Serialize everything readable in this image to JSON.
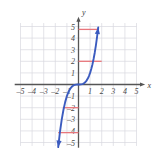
{
  "figure": {
    "background": "#ffffff",
    "grid_color": "#d8d8e0",
    "axis_color": "#555555",
    "curve_color": "#3b5bbf",
    "marker_color": "#e8767c"
  },
  "chart_data": {
    "type": "line",
    "title": "",
    "xlabel": "x",
    "ylabel": "y",
    "grid": true,
    "legend": null,
    "xlim": [
      -5.6,
      5.6
    ],
    "ylim": [
      -5.6,
      5.6
    ],
    "xticks": [
      -5,
      -4,
      -3,
      -2,
      -1,
      1,
      2,
      3,
      4,
      5
    ],
    "yticks": [
      -5,
      -4,
      -3,
      -2,
      -1,
      1,
      2,
      3,
      4,
      5
    ],
    "xtick_labels": [
      "-5",
      "-4",
      "-3",
      "-2",
      "-1",
      "1",
      "2",
      "3",
      "4",
      "5"
    ],
    "ytick_labels": [
      "-5",
      "-4",
      "-3",
      "-2",
      "-1",
      "1",
      "2",
      "3",
      "4",
      "5"
    ],
    "series": [
      {
        "name": "cubic curve",
        "color": "#3b5bbf",
        "arrow_start": true,
        "arrow_end": true,
        "x": [
          -1.75,
          -1.6,
          -1.45,
          -1.3,
          -1.15,
          -1.0,
          -0.9,
          -0.8,
          -0.7,
          -0.6,
          -0.5,
          -0.4,
          -0.3,
          -0.2,
          -0.1,
          0.0,
          0.1,
          0.2,
          0.3,
          0.4,
          0.5,
          0.6,
          0.7,
          0.8,
          0.9,
          1.0,
          1.1,
          1.2,
          1.3,
          1.4,
          1.5,
          1.6,
          1.7
        ],
        "y": [
          -5.4,
          -4.1,
          -3.05,
          -2.2,
          -1.52,
          -1.0,
          -0.73,
          -0.51,
          -0.34,
          -0.22,
          -0.13,
          -0.06,
          -0.03,
          -0.01,
          0.0,
          0.0,
          0.0,
          0.01,
          0.03,
          0.06,
          0.13,
          0.22,
          0.34,
          0.51,
          0.73,
          1.0,
          1.33,
          1.73,
          2.2,
          2.74,
          3.38,
          4.1,
          4.91
        ]
      }
    ],
    "markers": [
      {
        "name": "upper-outer-segment",
        "type": "hline",
        "y": 4.75,
        "x_start": 0.0,
        "x_end": 1.68,
        "color": "#e8767c"
      },
      {
        "name": "upper-inner-segment",
        "type": "hline",
        "y": 2.0,
        "x_start": 0.0,
        "x_end": 2.0,
        "color": "#e8767c"
      },
      {
        "name": "lower-inner-segment",
        "type": "hline",
        "y": -2.0,
        "x_start": -1.35,
        "x_end": 0.0,
        "color": "#e8767c"
      },
      {
        "name": "lower-outer-segment",
        "type": "hline",
        "y": -4.15,
        "x_start": -1.75,
        "x_end": 0.0,
        "color": "#e8767c"
      }
    ]
  }
}
